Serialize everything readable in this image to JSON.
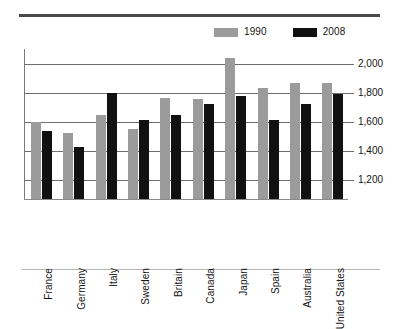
{
  "chart_data": {
    "type": "bar",
    "title": "",
    "subtitle": "",
    "xlabel": "",
    "ylabel": "",
    "grid": true,
    "legend_position": "top-right",
    "ylim": [
      1070,
      2100
    ],
    "yticks": [
      1200,
      1400,
      1600,
      1800,
      2000
    ],
    "ytick_labels": [
      "1,200",
      "1,400",
      "1,600",
      "1,800",
      "2,000"
    ],
    "categories": [
      "France",
      "Germany",
      "Italy",
      "Sweden",
      "Britain",
      "Canada",
      "Japan",
      "Spain",
      "Australia",
      "United States"
    ],
    "series": [
      {
        "name": "1990",
        "color": "#9b9b9b",
        "values": [
          1600,
          1525,
          1650,
          1550,
          1765,
          1760,
          2035,
          1830,
          1870,
          1865
        ]
      },
      {
        "name": "2008",
        "color": "#111111",
        "values": [
          1540,
          1425,
          1800,
          1615,
          1650,
          1725,
          1775,
          1615,
          1720,
          1790
        ]
      }
    ]
  },
  "legend": {
    "items": [
      {
        "label": "1990",
        "color": "#9b9b9b",
        "swatch_name": "legend-swatch-1990"
      },
      {
        "label": "2008",
        "color": "#111111",
        "swatch_name": "legend-swatch-2008"
      }
    ]
  },
  "rules": {
    "top_color": "#4a4a4a",
    "bottom_color": "#b5b5b5"
  }
}
